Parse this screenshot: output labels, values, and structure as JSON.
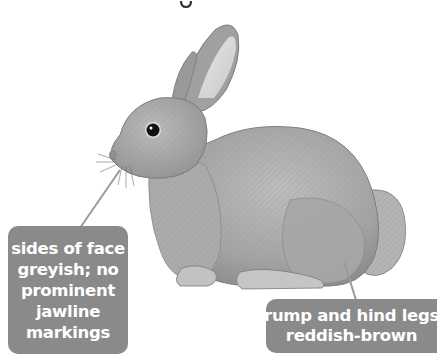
{
  "figure": {
    "title_fragment": "g",
    "callouts": [
      {
        "id": "face",
        "lines": [
          "sides of face",
          "greyish; no",
          "prominent",
          "jawline",
          "markings"
        ]
      },
      {
        "id": "rump",
        "lines": [
          "rump and hind legs",
          "reddish-brown"
        ]
      }
    ],
    "colors": {
      "label_bg": "#8a8a8a",
      "label_text": "#ffffff",
      "pointer_line": "#9a9a9a",
      "fur_base": "#a8a8a8",
      "background": "#ffffff"
    }
  }
}
